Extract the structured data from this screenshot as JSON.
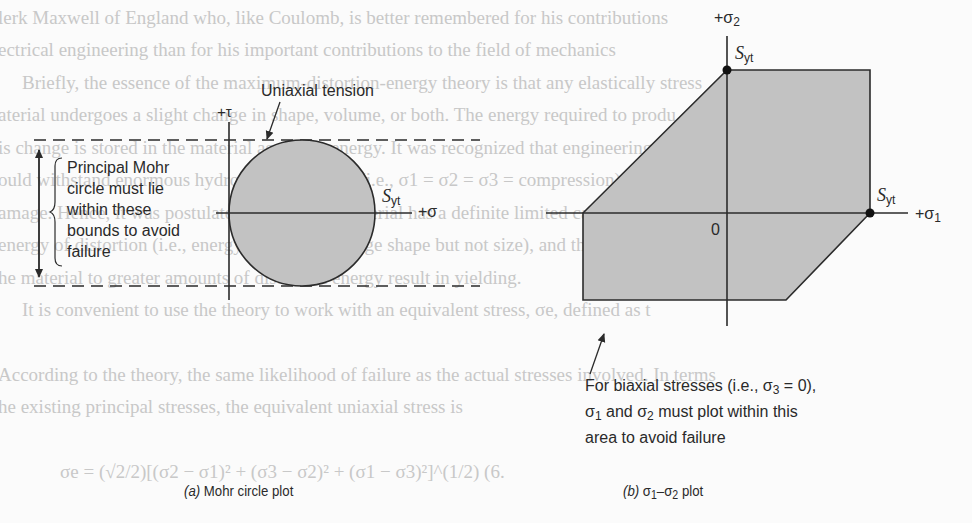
{
  "background_text_lines": [
    "lerk Maxwell of England who, like Coulomb, is better remembered for his contributions",
    "ectrical engineering than for his important contributions to the field of mechanics",
    "Briefly, the essence of the maximum-distortion-energy theory is that any elastically stress",
    "aterial undergoes a slight change in shape, volume, or both. The energy required to produ",
    "is change is stored in the material as elastic energy. It was recognized that engineering materi",
    "ould withstand enormous hydrostatic pressures (i.e., σ1 = σ2 = σ3 = compression) withou",
    "amage. Hence, it was postulated that a given material has a definite limited capacity to abso",
    "energy of distortion (i.e., energy tending to change shape but not size), and that attempts to subje",
    "he material to greater amounts of distortion energy result in yielding.",
    "It is convenient to use the theory to work with an equivalent stress, σe, defined as t",
    "According to the theory, the same likelihood of failure as the actual stresses involved. In terms",
    "he existing principal stresses, the equivalent uniaxial stress is",
    "σe = (√2/2)[(σ2 − σ1)² + (σ3 − σ2)² + (σ1 − σ3)²]^(1/2)          (6."
  ],
  "panel_a": {
    "caption_letter": "(a)",
    "caption_text": " Mohr circle plot",
    "axis_tau_label": "+τ",
    "axis_sigma_label": "+σ",
    "syt_label_S": "S",
    "syt_label_sub": "yt",
    "uniaxial_label": "Uniaxial tension",
    "bounds_note_lines": [
      "Principal Mohr",
      "circle must lie",
      "within these",
      "bounds to avoid",
      "failure"
    ]
  },
  "panel_b": {
    "caption_letter": "(b)",
    "caption_text": " σ",
    "caption_sub1": "1",
    "caption_dash": "–σ",
    "caption_sub2": "2",
    "caption_tail": " plot",
    "axis_sigma2_label": "+σ",
    "axis_sigma2_sub": "2",
    "axis_sigma1_label": "+σ",
    "axis_sigma1_sub": "1",
    "origin_label": "0",
    "syt_top_S": "S",
    "syt_top_sub": "yt",
    "syt_right_S": "S",
    "syt_right_sub": "yt",
    "note_line1": "For biaxial stresses (i.e., σ",
    "note_line1_sub": "3",
    "note_line1_tail": " = 0),",
    "note_line2_a": "σ",
    "note_line2_sub1": "1",
    "note_line2_b": " and σ",
    "note_line2_sub2": "2",
    "note_line2_tail": " must plot within this",
    "note_line3": "area to avoid failure"
  },
  "colors": {
    "fill": "#c2c2c2",
    "stroke": "#2b2b2b",
    "bleed_text": "#c8c8c8"
  }
}
